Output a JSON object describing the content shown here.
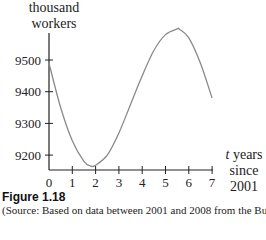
{
  "chart_data": {
    "type": "line",
    "title": "Figure 1.18",
    "ylabel_lines": [
      "thousand",
      "workers"
    ],
    "xlabel_var": "t",
    "xlabel_rest": " years",
    "xlabel_line2": "since 2001",
    "x_ticks": [
      0,
      1,
      2,
      3,
      4,
      5,
      6,
      7
    ],
    "y_ticks": [
      9200,
      9300,
      9400,
      9500
    ],
    "xlim": [
      0,
      7
    ],
    "ylim": [
      9160,
      9620
    ],
    "grid": false,
    "legend": null,
    "series": [
      {
        "name": "thousand workers",
        "x": [
          0,
          0.5,
          1,
          1.5,
          1.8,
          2,
          2.5,
          3,
          3.5,
          4,
          4.5,
          5,
          5.5,
          5.6,
          6,
          6.5,
          7
        ],
        "values": [
          9490,
          9350,
          9245,
          9180,
          9165,
          9168,
          9200,
          9270,
          9360,
          9450,
          9530,
          9580,
          9598,
          9597,
          9570,
          9490,
          9380
        ]
      }
    ],
    "caption": "(Source: Based on data between 2001 and 2008 from the Bureau of"
  },
  "figure": {
    "label": "Figure 1.18",
    "source_text": "(Source: Based on data between 2001 and 2008 from the Bureau of"
  },
  "axes": {
    "ylabel_1": "thousand",
    "ylabel_2": "workers",
    "xlabel_var": "t",
    "xlabel_rest": " years",
    "xlabel_2": "since 2001"
  }
}
